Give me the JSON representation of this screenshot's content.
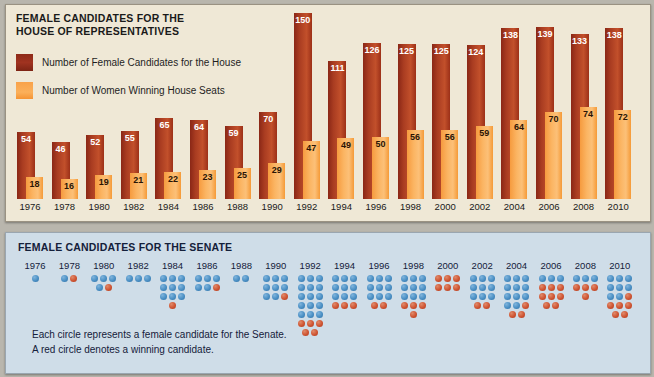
{
  "house": {
    "title_line1": "FEMALE CANDIDATES FOR THE",
    "title_line2": "HOUSE OF REPRESENTATIVES",
    "legend": [
      {
        "label": "Number of Female Candidates for the House",
        "color": "#a03320",
        "key": "candidates"
      },
      {
        "label": "Number of Women Winning House Seats",
        "color": "#fbb05a",
        "key": "winners"
      }
    ]
  },
  "senate": {
    "title": "FEMALE CANDIDATES FOR THE SENATE",
    "note_line1": "Each circle represents a female candidate for the Senate.",
    "note_line2": "A red circle denotes a winning candidate.",
    "dot_blue_color": "#4a8fc4",
    "dot_red_color": "#cf5432"
  },
  "chart_data": [
    {
      "type": "bar",
      "title": "FEMALE CANDIDATES FOR THE HOUSE OF REPRESENTATIVES",
      "xlabel": "",
      "ylabel": "",
      "ylim": [
        0,
        150
      ],
      "grid": false,
      "legend_position": "top-left",
      "categories": [
        "1976",
        "1978",
        "1980",
        "1982",
        "1984",
        "1986",
        "1988",
        "1990",
        "1992",
        "1994",
        "1996",
        "1998",
        "2000",
        "2002",
        "2004",
        "2006",
        "2008",
        "2010"
      ],
      "series": [
        {
          "name": "Number of Female Candidates for the House",
          "color": "#a03320",
          "values": [
            54,
            46,
            52,
            55,
            65,
            64,
            59,
            70,
            150,
            111,
            126,
            125,
            125,
            124,
            138,
            139,
            133,
            138
          ]
        },
        {
          "name": "Number of Women Winning House Seats",
          "color": "#fbb05a",
          "values": [
            18,
            16,
            19,
            21,
            22,
            23,
            25,
            29,
            47,
            49,
            50,
            56,
            56,
            59,
            64,
            70,
            74,
            72
          ]
        }
      ]
    },
    {
      "type": "scatter",
      "title": "FEMALE CANDIDATES FOR THE SENATE",
      "xlabel": "",
      "ylabel": "",
      "grid": false,
      "legend_position": "bottom-left",
      "categories": [
        "1976",
        "1978",
        "1980",
        "1982",
        "1984",
        "1986",
        "1988",
        "1990",
        "1992",
        "1994",
        "1996",
        "1998",
        "2000",
        "2002",
        "2004",
        "2006",
        "2008",
        "2010"
      ],
      "annotations": [
        "Each circle represents a female candidate for the Senate.",
        "A red circle denotes a winning candidate."
      ],
      "series": [
        {
          "name": "Female candidates (non-winning)",
          "color": "#4a8fc4",
          "values": [
            1,
            1,
            5,
            3,
            9,
            5,
            2,
            8,
            15,
            9,
            9,
            9,
            0,
            9,
            11,
            3,
            3,
            8
          ]
        },
        {
          "name": "Winning candidates",
          "color": "#cf5432",
          "values": [
            0,
            1,
            1,
            0,
            1,
            1,
            0,
            1,
            5,
            3,
            2,
            4,
            6,
            2,
            5,
            8,
            4,
            5
          ]
        }
      ],
      "columns": [
        {
          "year": "1976",
          "rows": [
            [
              "b"
            ]
          ]
        },
        {
          "year": "1978",
          "rows": [
            [
              "b",
              "r"
            ]
          ]
        },
        {
          "year": "1980",
          "rows": [
            [
              "b",
              "b",
              "b"
            ],
            [
              "b",
              "r"
            ]
          ]
        },
        {
          "year": "1982",
          "rows": [
            [
              "b",
              "b",
              "b"
            ]
          ]
        },
        {
          "year": "1984",
          "rows": [
            [
              "b",
              "b",
              "b"
            ],
            [
              "b",
              "b",
              "b"
            ],
            [
              "b",
              "b",
              "b"
            ],
            [
              "r"
            ]
          ]
        },
        {
          "year": "1986",
          "rows": [
            [
              "b",
              "b",
              "b"
            ],
            [
              "b",
              "b",
              "r"
            ]
          ]
        },
        {
          "year": "1988",
          "rows": [
            [
              "b",
              "b"
            ]
          ]
        },
        {
          "year": "1990",
          "rows": [
            [
              "b",
              "b",
              "b"
            ],
            [
              "b",
              "b",
              "b"
            ],
            [
              "b",
              "b",
              "r"
            ]
          ]
        },
        {
          "year": "1992",
          "rows": [
            [
              "b",
              "b",
              "b"
            ],
            [
              "b",
              "b",
              "b"
            ],
            [
              "b",
              "b",
              "b"
            ],
            [
              "b",
              "b",
              "b"
            ],
            [
              "b",
              "b",
              "b"
            ],
            [
              "r",
              "r",
              "r"
            ],
            [
              "r",
              "r"
            ]
          ]
        },
        {
          "year": "1994",
          "rows": [
            [
              "b",
              "b",
              "b"
            ],
            [
              "b",
              "b",
              "b"
            ],
            [
              "b",
              "b",
              "b"
            ],
            [
              "r",
              "r",
              "r"
            ]
          ]
        },
        {
          "year": "1996",
          "rows": [
            [
              "b",
              "b",
              "b"
            ],
            [
              "b",
              "b",
              "b"
            ],
            [
              "b",
              "b",
              "b"
            ],
            [
              "r",
              "r"
            ]
          ]
        },
        {
          "year": "1998",
          "rows": [
            [
              "b",
              "b",
              "b"
            ],
            [
              "b",
              "b",
              "b"
            ],
            [
              "b",
              "b",
              "b"
            ],
            [
              "r",
              "r",
              "r"
            ],
            [
              "r"
            ]
          ]
        },
        {
          "year": "2000",
          "rows": [
            [
              "r",
              "r",
              "r"
            ],
            [
              "r",
              "r",
              "r"
            ]
          ]
        },
        {
          "year": "2002",
          "rows": [
            [
              "b",
              "b",
              "b"
            ],
            [
              "b",
              "b",
              "b"
            ],
            [
              "b",
              "b",
              "b"
            ],
            [
              "r",
              "r"
            ]
          ]
        },
        {
          "year": "2004",
          "rows": [
            [
              "b",
              "b",
              "b"
            ],
            [
              "b",
              "b",
              "b"
            ],
            [
              "b",
              "b",
              "b"
            ],
            [
              "b",
              "b",
              "r"
            ],
            [
              "r",
              "r"
            ]
          ]
        },
        {
          "year": "2006",
          "rows": [
            [
              "b",
              "b",
              "b"
            ],
            [
              "r",
              "r",
              "r"
            ],
            [
              "r",
              "r",
              "r"
            ],
            [
              "r",
              "r"
            ]
          ]
        },
        {
          "year": "2008",
          "rows": [
            [
              "b",
              "b",
              "b"
            ],
            [
              "r",
              "r",
              "r"
            ],
            [
              "r"
            ]
          ]
        },
        {
          "year": "2010",
          "rows": [
            [
              "b",
              "b",
              "b"
            ],
            [
              "b",
              "b",
              "b"
            ],
            [
              "b",
              "b",
              "r"
            ],
            [
              "r",
              "r",
              "r"
            ],
            [
              "r",
              "r"
            ]
          ]
        }
      ]
    }
  ]
}
